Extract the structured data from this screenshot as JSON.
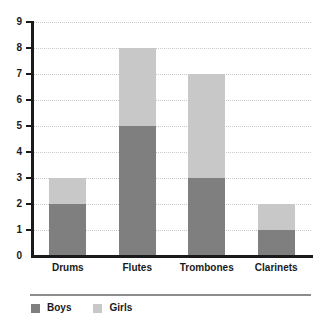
{
  "chart_data": {
    "type": "bar",
    "stacked": true,
    "title": "",
    "xlabel": "",
    "ylabel": "",
    "categories": [
      "Drums",
      "Flutes",
      "Trombones",
      "Clarinets"
    ],
    "series": [
      {
        "name": "Boys",
        "color": "#7f7f7f",
        "values": [
          2,
          5,
          3,
          1
        ]
      },
      {
        "name": "Girls",
        "color": "#c8c8c8",
        "values": [
          1,
          3,
          4,
          1
        ]
      }
    ],
    "totals": [
      3,
      8,
      7,
      2
    ],
    "ylim": [
      0,
      9
    ],
    "ytick_labels": [
      "0",
      "1",
      "2",
      "3",
      "4",
      "5",
      "6",
      "7",
      "8",
      "9"
    ],
    "grid": true,
    "grid_style": "dotted",
    "grid_color": "#c9c9c9",
    "axis_color": "#1a1a1a",
    "legend_position": "bottom-left"
  },
  "legend": {
    "items": [
      {
        "label": "Boys",
        "color": "#7f7f7f"
      },
      {
        "label": "Girls",
        "color": "#c8c8c8"
      }
    ]
  }
}
